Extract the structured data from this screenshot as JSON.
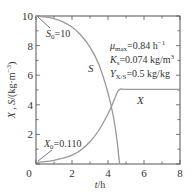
{
  "chart_data": {
    "type": "line",
    "title": "",
    "xlabel": "t/h",
    "ylabel": "X , S/(kg·m⁻³)",
    "xlim": [
      0,
      8
    ],
    "ylim": [
      0,
      10
    ],
    "xticks": [
      0,
      2,
      4,
      6,
      8
    ],
    "yticks": [
      0,
      2,
      4,
      6,
      8,
      10
    ],
    "grid": false,
    "series": [
      {
        "name": "S",
        "x": [
          0,
          0.5,
          1,
          1.5,
          2,
          2.5,
          3,
          3.5,
          4,
          4.3,
          4.5,
          4.6,
          4.65
        ],
        "values": [
          10,
          9.94,
          9.82,
          9.6,
          9.25,
          8.7,
          7.9,
          6.7,
          4.8,
          3.2,
          1.6,
          0.5,
          0
        ]
      },
      {
        "name": "X",
        "x": [
          0,
          0.5,
          1,
          1.5,
          2,
          2.5,
          3,
          3.5,
          4,
          4.3,
          4.5,
          4.65,
          5,
          6,
          7,
          8
        ],
        "values": [
          0.11,
          0.16,
          0.25,
          0.4,
          0.6,
          0.95,
          1.5,
          2.3,
          3.4,
          4.2,
          4.8,
          5.05,
          5.05,
          5.05,
          5.05,
          5.05
        ]
      }
    ],
    "annotations": [
      {
        "text": "S₀=10",
        "x": 0.6,
        "y": 9.0
      },
      {
        "text": "X₀=0.110",
        "x": 1.0,
        "y": 1.3
      },
      {
        "text": "μmax=0.84 h⁻¹",
        "x": 5.3,
        "y": 7.8
      },
      {
        "text": "Ks=0.074 kg/m³",
        "x": 5.3,
        "y": 7.0
      },
      {
        "text": "YX/S=0.5 kg/kg",
        "x": 5.3,
        "y": 6.2
      }
    ],
    "line_color": "#999999"
  },
  "labels": {
    "s_curve": "S",
    "x_curve": "X",
    "s0": "S",
    "s0_sub": "0",
    "s0_val": "=10",
    "x0": "X",
    "x0_sub": "0",
    "x0_val": "=0.110",
    "mu": "μ",
    "mu_sub": "max",
    "mu_val": "=0.84 h",
    "mu_sup": "−1",
    "ks": "K",
    "ks_sub": "s",
    "ks_val": "=0.074 kg/m",
    "ks_sup": "3",
    "yxs": "Y",
    "yxs_sub": "X/S",
    "yxs_val": "=0.5 kg/kg",
    "xlabel_t": "t",
    "xlabel_unit": "/h",
    "ylabel_x": "X",
    "ylabel_sep": " , ",
    "ylabel_s": "S",
    "ylabel_unit": "/(kg·m",
    "ylabel_sup": "−3",
    "ylabel_close": ")"
  },
  "ticks": {
    "x": [
      "0",
      "2",
      "4",
      "6",
      "8"
    ],
    "y": [
      "2",
      "4",
      "6",
      "8",
      "10"
    ]
  }
}
